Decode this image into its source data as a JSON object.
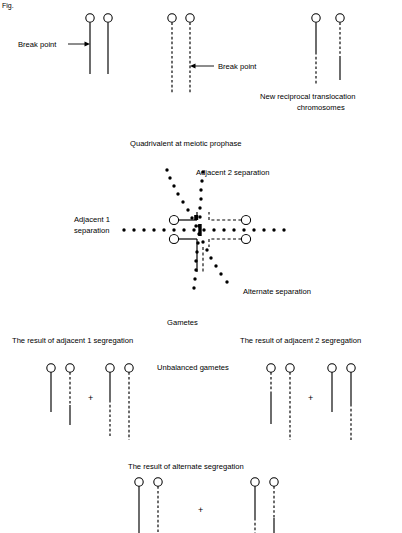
{
  "figure": {
    "corner_mark": "Fig.",
    "panels": {
      "break_points": {
        "label_left": "Break point",
        "label_right": "Break point",
        "caption_right": "New reciprocal translocation chromosomes",
        "caption_right_line1": "New reciprocal translocation",
        "caption_right_line2": "chromosomes",
        "pair_normal_solid": {
          "name": "normal-solid-pair",
          "chromosomes": [
            {
              "id": "solid-a",
              "pattern": "solid",
              "top": 22,
              "bottom": 74,
              "x": 90
            },
            {
              "id": "solid-b",
              "pattern": "solid",
              "top": 22,
              "bottom": 74,
              "x": 108
            }
          ]
        },
        "pair_normal_dashed": {
          "name": "normal-dashed-pair",
          "chromosomes": [
            {
              "id": "dashed-a",
              "pattern": "dashed",
              "top": 22,
              "bottom": 93,
              "x": 172
            },
            {
              "id": "dashed-b",
              "pattern": "dashed",
              "top": 22,
              "bottom": 93,
              "x": 190
            }
          ]
        },
        "pair_translocated": {
          "name": "translocation-product-pair",
          "chromosomes": [
            {
              "id": "trans-a",
              "pattern": "solid-then-dashed",
              "top": 22,
              "break": 52,
              "bottom": 85,
              "x": 316
            },
            {
              "id": "trans-b",
              "pattern": "dashed-then-solid",
              "top": 22,
              "break": 58,
              "bottom": 80,
              "x": 340
            }
          ]
        }
      },
      "quadrivalent": {
        "title": "Quadrivalent at meiotic prophase",
        "label_adjacent1": "Adjacent 1 separation",
        "label_adjacent1_line1": "Adjacent 1",
        "label_adjacent1_line2": "separation",
        "label_adjacent2": "Adjacent 2 separation",
        "label_alternate": "Alternate separation",
        "arms": [
          {
            "id": "upper-left",
            "pattern": "solid",
            "centromere": [
              174,
              220
            ]
          },
          {
            "id": "lower-left",
            "pattern": "solid",
            "centromere": [
              174,
              239
            ]
          },
          {
            "id": "upper-right",
            "pattern": "dashed",
            "centromere": [
              246,
              220
            ]
          },
          {
            "id": "lower-right",
            "pattern": "dashed",
            "centromere": [
              246,
              239
            ]
          }
        ],
        "separations": [
          {
            "name": "adjacent-1",
            "orientation": "horizontal",
            "style": "dotted"
          },
          {
            "name": "adjacent-2",
            "orientation": "steep-diagonal",
            "style": "dotted"
          },
          {
            "name": "alternate",
            "orientation": "diagonal",
            "style": "dotted"
          }
        ]
      },
      "gametes": {
        "title": "Gametes",
        "label_adjacent1_result": "The result of adjacent 1 segregation",
        "label_adjacent2_result": "The result of adjacent 2 segregation",
        "label_unbalanced": "Unbalanced gametes",
        "label_alternate_result": "The result of alternate segregation",
        "plus_sign": "+",
        "adjacent1": {
          "group_a": [
            {
              "id": "a1-1",
              "pattern": "solid",
              "x": 51,
              "top": 372,
              "bottom": 412
            },
            {
              "id": "a1-2",
              "pattern": "dashed-then-solid",
              "x": 70,
              "top": 372,
              "break": 405,
              "bottom": 425
            }
          ],
          "group_b": [
            {
              "id": "a1-3",
              "pattern": "solid-then-dashed",
              "x": 110,
              "top": 372,
              "break": 400,
              "bottom": 436
            },
            {
              "id": "a1-4",
              "pattern": "dashed",
              "x": 129,
              "top": 372,
              "bottom": 440
            }
          ]
        },
        "adjacent2": {
          "group_a": [
            {
              "id": "a2-1",
              "pattern": "dashed-then-solid",
              "x": 271,
              "top": 372,
              "break": 394,
              "bottom": 424
            },
            {
              "id": "a2-2",
              "pattern": "dashed",
              "x": 290,
              "top": 372,
              "bottom": 440
            }
          ],
          "group_b": [
            {
              "id": "a2-3",
              "pattern": "solid",
              "x": 332,
              "top": 372,
              "bottom": 412
            },
            {
              "id": "a2-4",
              "pattern": "solid-then-dashed",
              "x": 351,
              "top": 372,
              "break": 404,
              "bottom": 440
            }
          ]
        },
        "alternate": {
          "group_a": [
            {
              "id": "alt-1",
              "pattern": "solid",
              "x": 139,
              "top": 486,
              "bottom": 533
            },
            {
              "id": "alt-2",
              "pattern": "dashed",
              "x": 158,
              "top": 486,
              "bottom": 533
            }
          ],
          "group_b": [
            {
              "id": "alt-3",
              "pattern": "solid-then-dashed",
              "x": 255,
              "top": 486,
              "break": 518,
              "bottom": 533
            },
            {
              "id": "alt-4",
              "pattern": "dashed-then-solid",
              "x": 274,
              "top": 486,
              "break": 518,
              "bottom": 533
            }
          ]
        }
      }
    }
  },
  "colors": {
    "ink": "#000000",
    "background": "#ffffff"
  }
}
